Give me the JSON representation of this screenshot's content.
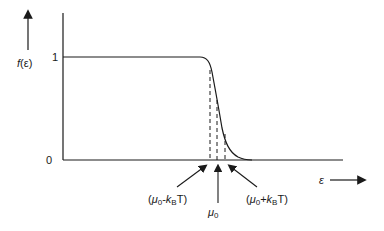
{
  "diagram": {
    "y_axis_label": "f(ε)",
    "x_axis_label": "ε",
    "y_ticks": [
      "1",
      "0"
    ],
    "annotations": {
      "left": "(μ0-kBT)",
      "center": "μ0",
      "right": "(μ0+kBT)"
    },
    "colors": {
      "stroke": "#1a1a1a",
      "background": "#ffffff"
    }
  }
}
